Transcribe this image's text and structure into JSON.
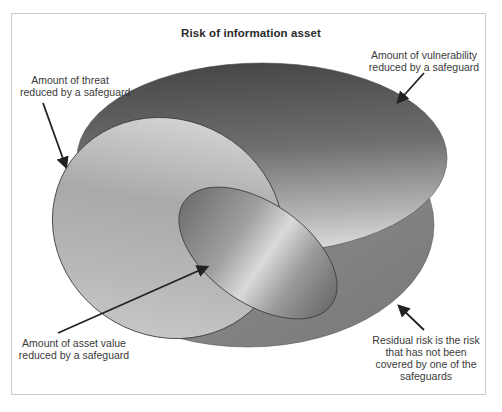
{
  "figure": {
    "title": "Risk of information asset"
  },
  "labels": {
    "threat": {
      "lines": [
        "Amount of threat",
        "reduced by a safeguard"
      ]
    },
    "vulnerability": {
      "lines": [
        "Amount of vulnerability",
        "reduced by a safeguard"
      ]
    },
    "asset_value": {
      "lines": [
        "Amount of asset value",
        "reduced by a safeguard"
      ]
    },
    "residual": {
      "lines": [
        "Residual risk is the risk",
        "that has not been",
        "covered by one of the",
        "safeguards"
      ]
    }
  },
  "regions": [
    {
      "name": "residual-risk-base",
      "color": "#7e7e7e"
    },
    {
      "name": "vulnerability-reduced",
      "color_top": "#4b4b4b",
      "color_bottom": "#d6d6d6"
    },
    {
      "name": "threat-reduced",
      "color_top": "#d2d2d2",
      "color_bottom": "#a8a8a8"
    },
    {
      "name": "asset-value-reduced",
      "color_edge": "#6e6e6e",
      "color_center": "#d8d8d8"
    }
  ],
  "colors": {
    "frame_border": "#c9c9c9",
    "arrow": "#222222",
    "outline": "#3c3c3c"
  }
}
